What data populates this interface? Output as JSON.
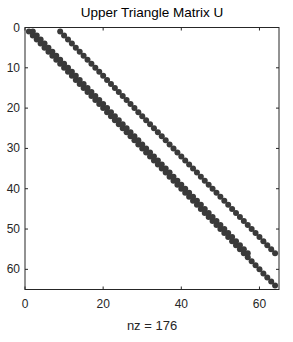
{
  "chart_data": {
    "type": "scatter",
    "subtype": "spy-sparsity-pattern",
    "title": "Upper Triangle Matrix U",
    "xlabel": "nz = 176",
    "ylabel": "",
    "nz": 176,
    "matrix_size": [
      64,
      64
    ],
    "xlim": [
      0,
      65
    ],
    "ylim": [
      0,
      65
    ],
    "y_reversed": true,
    "grid": false,
    "legend": null,
    "xticks": [
      0,
      20,
      40,
      60
    ],
    "yticks": [
      0,
      10,
      20,
      30,
      40,
      50,
      60
    ],
    "marker_color": "#3a3a3a",
    "series": [
      {
        "name": "main diagonal",
        "offset": 0,
        "row_start": 1,
        "row_end": 64,
        "count": 64
      },
      {
        "name": "first superdiagonal",
        "offset": 1,
        "row_start": 1,
        "row_end": 56,
        "count": 56
      },
      {
        "name": "eighth superdiagonal",
        "offset": 8,
        "row_start": 1,
        "row_end": 56,
        "count": 56
      }
    ]
  }
}
